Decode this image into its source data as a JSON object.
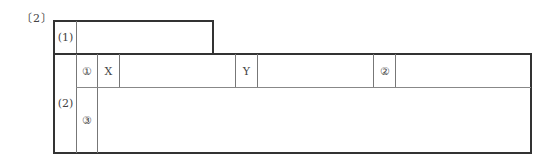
{
  "section": {
    "label": "〔2〕"
  },
  "part1": {
    "label": "(1)",
    "answer": ""
  },
  "part2": {
    "label": "(2)",
    "row1": {
      "sub_label": "①",
      "x_label": "X",
      "x_value": "",
      "y_label": "Y",
      "y_value": "",
      "item2_label": "②",
      "item2_value": ""
    },
    "row2": {
      "sub_label": "③",
      "value": ""
    }
  }
}
